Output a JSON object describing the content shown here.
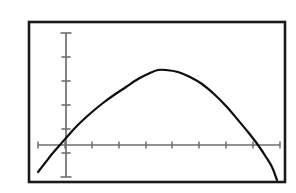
{
  "figure": {
    "title": "",
    "caption": "",
    "background_color": "#ffffff",
    "border": {
      "name": "plot-frame",
      "color": "#1a1a1a",
      "x": 29,
      "y": 22,
      "width": 256,
      "height": 160,
      "stroke_width": 2.6
    },
    "watermark_text": ""
  },
  "axes": {
    "axis_color": "#6e6e6e",
    "stroke_width": 1.6,
    "tick_length": 7,
    "x_axis": {
      "name": "x-axis",
      "label": "",
      "y_pixel": 145,
      "x_start_pixel": 38,
      "x_end_pixel": 280,
      "tick_count": 10,
      "tick_spacing_pixels": 26.9,
      "tick_pixels": [
        38,
        65,
        92,
        119,
        146,
        172,
        199,
        226,
        253,
        280
      ],
      "tick_labels": []
    },
    "y_axis": {
      "name": "y-axis",
      "label": "",
      "x_pixel": 66,
      "y_top_pixel": 33,
      "y_bottom_pixel": 177,
      "tick_count": 7,
      "tick_spacing_pixels": 24,
      "tick_pixels": [
        33,
        57,
        81,
        105,
        129,
        153,
        177
      ],
      "tick_labels": []
    },
    "origin_pixel": {
      "x": 66,
      "y": 145
    }
  },
  "chart_data": {
    "type": "line",
    "title": "",
    "subtitle": "",
    "xlabel": "",
    "ylabel": "",
    "grid": false,
    "legend": null,
    "curve_name": "downward-parabola",
    "curve_color": "#0d0d0d",
    "curve_stroke_width": 2.2,
    "x_axis_range_data": [
      -1.0,
      8.0
    ],
    "y_axis_range_data": [
      -2.0,
      4.0
    ],
    "vertex_data": [
      3.3,
      2.78
    ],
    "x_intercepts_data": [
      -0.44,
      7.04
    ],
    "y_intercept_data": 1.0,
    "equation": "y = -0.37x^2 + 2.45x + 1.0",
    "x": [
      -1.0,
      -0.5,
      0.0,
      0.5,
      1.0,
      1.5,
      2.0,
      2.5,
      3.0,
      3.3,
      3.5,
      4.0,
      4.5,
      5.0,
      5.5,
      6.0,
      6.5,
      7.0,
      7.5,
      8.0
    ],
    "y": [
      -1.82,
      -0.32,
      1.0,
      2.13,
      3.08,
      3.84,
      4.42,
      4.81,
      5.02,
      5.05,
      5.04,
      4.88,
      4.53,
      4.0,
      3.29,
      2.39,
      1.31,
      0.05,
      -1.39,
      -3.02
    ],
    "points_pixels": [
      [
        38,
        172
      ],
      [
        45,
        163
      ],
      [
        52,
        154
      ],
      [
        59,
        146
      ],
      [
        66,
        138
      ],
      [
        74,
        129
      ],
      [
        82,
        121
      ],
      [
        92,
        112
      ],
      [
        103,
        103
      ],
      [
        114,
        95
      ],
      [
        126,
        87
      ],
      [
        138,
        79
      ],
      [
        150,
        73
      ],
      [
        158,
        70
      ],
      [
        166,
        70
      ],
      [
        178,
        72
      ],
      [
        190,
        77
      ],
      [
        202,
        84
      ],
      [
        214,
        94
      ],
      [
        226,
        106
      ],
      [
        238,
        120
      ],
      [
        248,
        132
      ],
      [
        258,
        145
      ],
      [
        266,
        157
      ],
      [
        272,
        167
      ],
      [
        277,
        180
      ]
    ]
  }
}
